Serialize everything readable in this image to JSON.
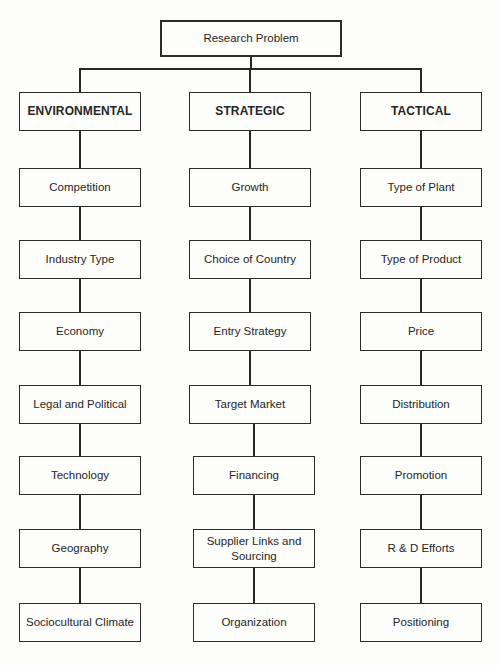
{
  "diagram": {
    "type": "hierarchy",
    "root": {
      "label": "Research Problem"
    },
    "columns": [
      {
        "header": "ENVIRONMENTAL",
        "items": [
          "Competition",
          "Industry Type",
          "Economy",
          "Legal and Political",
          "Technology",
          "Geography",
          "Sociocultural Climate"
        ]
      },
      {
        "header": "STRATEGIC",
        "items": [
          "Growth",
          "Choice of Country",
          "Entry Strategy",
          "Target Market",
          "Financing",
          "Supplier Links and Sourcing",
          "Organization"
        ]
      },
      {
        "header": "TACTICAL",
        "items": [
          "Type of Plant",
          "Type of Product",
          "Price",
          "Distribution",
          "Promotion",
          "R & D Efforts",
          "Positioning"
        ]
      }
    ]
  },
  "colors": {
    "line": "#262626",
    "background": "#fdfdfb",
    "text": "#262626"
  }
}
